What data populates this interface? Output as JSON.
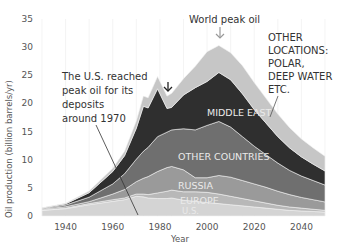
{
  "chart_data": {
    "type": "area",
    "stacked": true,
    "title": "",
    "xlabel": "Year",
    "ylabel": "Oil production (billion barrels/yr)",
    "xlim": [
      1930,
      2050
    ],
    "ylim": [
      0,
      35
    ],
    "x_ticks": [
      1940,
      1960,
      1980,
      2000,
      2020,
      2040
    ],
    "y_ticks": [
      0,
      5,
      10,
      15,
      20,
      25,
      30,
      35
    ],
    "grid": {
      "vertical": true,
      "horizontal": false
    },
    "legend": "none (inline labels)",
    "x": [
      1930,
      1940,
      1950,
      1960,
      1965,
      1970,
      1973,
      1975,
      1979,
      1983,
      1985,
      1990,
      1995,
      2000,
      2005,
      2010,
      2015,
      2020,
      2025,
      2030,
      2035,
      2040,
      2045,
      2050
    ],
    "series": [
      {
        "name": "U.S.",
        "color": "#d4d4d4",
        "values": [
          1.0,
          1.3,
          2.0,
          2.6,
          2.9,
          3.5,
          3.4,
          3.2,
          3.1,
          3.1,
          3.2,
          2.8,
          2.6,
          2.4,
          2.2,
          2.0,
          1.8,
          1.6,
          1.4,
          1.2,
          1.0,
          0.9,
          0.8,
          0.7
        ]
      },
      {
        "name": "Europe",
        "color": "#b8b8b8",
        "values": [
          0.05,
          0.1,
          0.2,
          0.3,
          0.3,
          0.4,
          0.5,
          0.6,
          1.0,
          1.3,
          1.4,
          1.5,
          1.7,
          1.8,
          1.7,
          1.5,
          1.3,
          1.1,
          0.9,
          0.7,
          0.6,
          0.5,
          0.4,
          0.3
        ]
      },
      {
        "name": "Russia",
        "color": "#9a9a9a",
        "values": [
          0.15,
          0.25,
          0.35,
          1.0,
          1.5,
          2.2,
          2.8,
          3.2,
          3.8,
          4.2,
          4.2,
          3.9,
          2.5,
          2.6,
          3.3,
          3.4,
          3.2,
          3.0,
          2.8,
          2.5,
          2.2,
          1.9,
          1.7,
          1.5
        ]
      },
      {
        "name": "Other countries",
        "color": "#6f6f6f",
        "values": [
          0.1,
          0.3,
          0.8,
          1.8,
          2.8,
          4.0,
          4.8,
          5.2,
          6.2,
          6.3,
          6.5,
          7.3,
          8.5,
          9.3,
          9.6,
          8.9,
          7.8,
          6.7,
          5.8,
          5.0,
          4.3,
          3.8,
          3.4,
          3.0
        ]
      },
      {
        "name": "Middle East",
        "color": "#2f2f2f",
        "values": [
          0.1,
          0.2,
          0.8,
          2.2,
          3.2,
          5.5,
          8.0,
          7.0,
          8.5,
          4.2,
          4.0,
          6.0,
          7.5,
          7.8,
          8.7,
          8.4,
          7.6,
          6.5,
          5.6,
          4.7,
          4.0,
          3.4,
          2.9,
          2.5
        ]
      },
      {
        "name": "Other locations: polar, deep water etc.",
        "color": "#c6c6c6",
        "values": [
          0.05,
          0.1,
          0.3,
          0.6,
          0.8,
          1.3,
          1.8,
          1.8,
          2.2,
          2.2,
          2.5,
          2.9,
          3.8,
          5.3,
          4.8,
          4.8,
          5.0,
          4.8,
          4.4,
          4.0,
          3.6,
          3.2,
          2.9,
          2.6
        ]
      }
    ],
    "annotations": [
      {
        "text": "World peak oil",
        "x": 2005,
        "y": 31,
        "arrow": "down"
      },
      {
        "text": "The U.S. reached peak oil for its deposits around 1970",
        "pointer_to": {
          "x": 1970,
          "y": 0.5
        }
      },
      {
        "text": "OTHER LOCATIONS: POLAR, DEEP WATER ETC.",
        "pointer_to": {
          "x": 2018,
          "y": 22
        }
      },
      {
        "text": "↓",
        "x": 1983,
        "y": 19.5,
        "note": "dip arrow marking early-1980s production drop"
      }
    ]
  },
  "labels": {
    "world_peak": "World peak oil",
    "us_peak_lines": [
      "The U.S. reached",
      "peak oil for its",
      "deposits",
      "around 1970"
    ],
    "other_locations_lines": [
      "OTHER",
      "LOCATIONS:",
      "POLAR,",
      "DEEP WATER",
      "ETC."
    ],
    "middle_east": "MIDDLE EAST",
    "other_countries": "OTHER COUNTRIES",
    "russia": "RUSSIA",
    "europe": "EUROPE",
    "us": "U.S."
  }
}
